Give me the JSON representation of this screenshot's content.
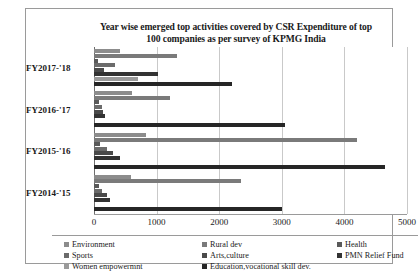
{
  "chart_data": {
    "type": "bar",
    "orientation": "horizontal",
    "title": "Year wise emerged top activities covered by CSR Expenditure of top 100 companies as per survey of KPMG India",
    "title_line1": "Year wise emerged top activities covered by  CSR Expenditure of top",
    "title_line2": "100 companies as per survey of KPMG India",
    "xlabel": "",
    "ylabel": "",
    "xlim": [
      0,
      5000
    ],
    "xticks": [
      0,
      1000,
      2000,
      3000,
      4000,
      5000
    ],
    "xtick_labels": [
      "0",
      "1000",
      "2000",
      "3000",
      "4000",
      "5000"
    ],
    "grid": true,
    "legend_position": "bottom",
    "categories": [
      "FY2017-'18",
      "FY2016-'17",
      "FY2015-'16",
      "FY2014-'15"
    ],
    "series": [
      {
        "name": "Environment",
        "color": "#8c8c8c",
        "values": [
          420,
          600,
          830,
          590
        ]
      },
      {
        "name": "Rural dev",
        "color": "#7a7a7a",
        "values": [
          1320,
          1220,
          4200,
          2350
        ]
      },
      {
        "name": "Health",
        "color": "#595959",
        "values": [
          60,
          85,
          95,
          80
        ]
      },
      {
        "name": "Sports",
        "color": "#6b6b6b",
        "values": [
          330,
          120,
          200,
          130
        ]
      },
      {
        "name": "Arts,culture",
        "color": "#4a4a4a",
        "values": [
          160,
          150,
          310,
          215
        ]
      },
      {
        "name": "PMN Relief Fund",
        "color": "#333333",
        "values": [
          1020,
          170,
          420,
          250
        ]
      },
      {
        "name": "Women empowermnt",
        "color": "#9a9a9a",
        "values": [
          700,
          0,
          0,
          0
        ]
      },
      {
        "name": "Education,vocational skill dev.",
        "color": "#262626",
        "values": [
          2200,
          3050,
          4650,
          3000
        ]
      }
    ],
    "legend_entries": [
      {
        "label": "Environment",
        "color": "#8c8c8c"
      },
      {
        "label": "Rural dev",
        "color": "#7a7a7a"
      },
      {
        "label": "Health",
        "color": "#595959"
      },
      {
        "label": "Sports",
        "color": "#6b6b6b"
      },
      {
        "label": "Arts,culture",
        "color": "#4a4a4a"
      },
      {
        "label": "PMN Relief Fund",
        "color": "#333333"
      },
      {
        "label": "Women empowermnt",
        "color": "#9a9a9a"
      },
      {
        "label": "Education,vocational skill dev.",
        "color": "#262626"
      }
    ]
  }
}
